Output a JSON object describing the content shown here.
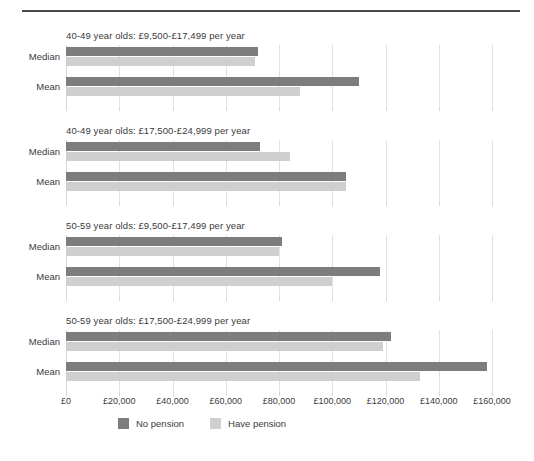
{
  "chart_data": {
    "type": "bar",
    "orientation": "horizontal",
    "title": "",
    "xlabel": "",
    "ylabel": "",
    "xlim": [
      0,
      160000
    ],
    "xticks": [
      0,
      20000,
      40000,
      60000,
      80000,
      100000,
      120000,
      140000,
      160000
    ],
    "xticklabels": [
      "£0",
      "£20,000",
      "£40,000",
      "£60,000",
      "£80,000",
      "£100,000",
      "£120,000",
      "£140,000",
      "£160,000"
    ],
    "categories": [
      "Median",
      "Mean"
    ],
    "grid": true,
    "legend_position": "bottom",
    "series": [
      {
        "name": "No pension",
        "color": "#7d7d7d"
      },
      {
        "name": "Have pension",
        "color": "#cfcfcf"
      }
    ],
    "panels": [
      {
        "title": "40-49 year olds: £9,500-£17,499 per year",
        "rows": [
          {
            "label": "Median",
            "no_pension": 72000,
            "have_pension": 71000
          },
          {
            "label": "Mean",
            "no_pension": 110000,
            "have_pension": 88000
          }
        ]
      },
      {
        "title": "40-49 year olds: £17,500-£24,999 per year",
        "rows": [
          {
            "label": "Median",
            "no_pension": 73000,
            "have_pension": 84000
          },
          {
            "label": "Mean",
            "no_pension": 105000,
            "have_pension": 105000
          }
        ]
      },
      {
        "title": "50-59 year olds: £9,500-£17,499 per year",
        "rows": [
          {
            "label": "Median",
            "no_pension": 81000,
            "have_pension": 80000
          },
          {
            "label": "Mean",
            "no_pension": 118000,
            "have_pension": 100000
          }
        ]
      },
      {
        "title": "50-59 year olds: £17,500-£24,999 per year",
        "rows": [
          {
            "label": "Median",
            "no_pension": 122000,
            "have_pension": 119000
          },
          {
            "label": "Mean",
            "no_pension": 158000,
            "have_pension": 133000
          }
        ]
      }
    ]
  },
  "legend": {
    "items": [
      {
        "label": "No pension",
        "color": "#7d7d7d"
      },
      {
        "label": "Have pension",
        "color": "#cfcfcf"
      }
    ]
  }
}
